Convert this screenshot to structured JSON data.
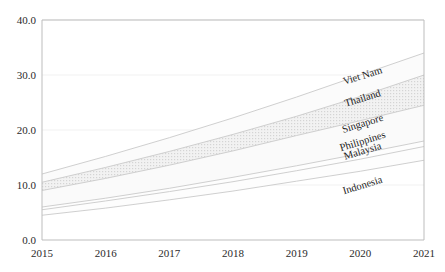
{
  "chart_data": {
    "type": "area",
    "title": "",
    "subtitle": "",
    "xlabel": "",
    "ylabel": "",
    "x": [
      2015,
      2016,
      2017,
      2018,
      2019,
      2020,
      2021
    ],
    "categories": [
      "2015",
      "2016",
      "2017",
      "2018",
      "2019",
      "2020",
      "2021"
    ],
    "xlim": [
      2015,
      2021
    ],
    "ylim": [
      0.0,
      40.0
    ],
    "yticks": [
      0.0,
      10.0,
      20.0,
      30.0,
      40.0
    ],
    "ytick_labels": [
      "0.0",
      "10.0",
      "20.0",
      "30.0",
      "40.0"
    ],
    "xtick_labels": [
      "2015",
      "2016",
      "2017",
      "2018",
      "2019",
      "2020",
      "2021"
    ],
    "grid": true,
    "legend": "inline-end-labels",
    "stacked": false,
    "series": [
      {
        "name": "Viet Nam",
        "values": [
          12.0,
          15.2,
          18.6,
          22.2,
          26.0,
          30.0,
          34.0
        ],
        "label_x": 2020.05,
        "label_y": 29.3
      },
      {
        "name": "Thailand",
        "values": [
          10.5,
          13.2,
          16.1,
          19.2,
          22.5,
          26.1,
          30.0
        ],
        "label_x": 2020.05,
        "label_y": 25.2
      },
      {
        "name": "Singapore",
        "values": [
          9.0,
          11.2,
          13.6,
          16.2,
          19.0,
          21.7,
          24.5
        ],
        "label_x": 2020.05,
        "label_y": 20.6
      },
      {
        "name": "Philippines",
        "values": [
          6.0,
          7.6,
          9.4,
          11.4,
          13.5,
          15.7,
          18.0
        ],
        "label_x": 2020.05,
        "label_y": 17.4
      },
      {
        "name": "Malaysia",
        "values": [
          5.5,
          7.1,
          8.8,
          10.6,
          12.6,
          14.7,
          17.0
        ],
        "label_x": 2020.05,
        "label_y": 15.6
      },
      {
        "name": "Indonesia",
        "values": [
          4.5,
          5.8,
          7.3,
          8.9,
          10.7,
          12.5,
          14.5
        ],
        "label_x": 2020.05,
        "label_y": 9.4
      }
    ],
    "bands": [
      {
        "upper": "Viet Nam",
        "lower": "Thailand",
        "fill": "#fbfbfb"
      },
      {
        "upper": "Thailand",
        "lower": "Singapore",
        "fill": "#eaeaea"
      },
      {
        "upper": "Singapore",
        "lower": "Philippines",
        "fill": "#fafafa"
      },
      {
        "upper": "Philippines",
        "lower": "Malaysia",
        "fill": "#fdfdfd"
      },
      {
        "upper": "Malaysia",
        "lower": "Indonesia",
        "fill": "#fdfdfd"
      }
    ],
    "colors": {
      "line": "#c9c9c9",
      "axis": "#bdbdbd",
      "grid": "#ededed",
      "text": "#2b2b2b",
      "band_highlight": "#eaeaea",
      "background": "#ffffff"
    }
  }
}
